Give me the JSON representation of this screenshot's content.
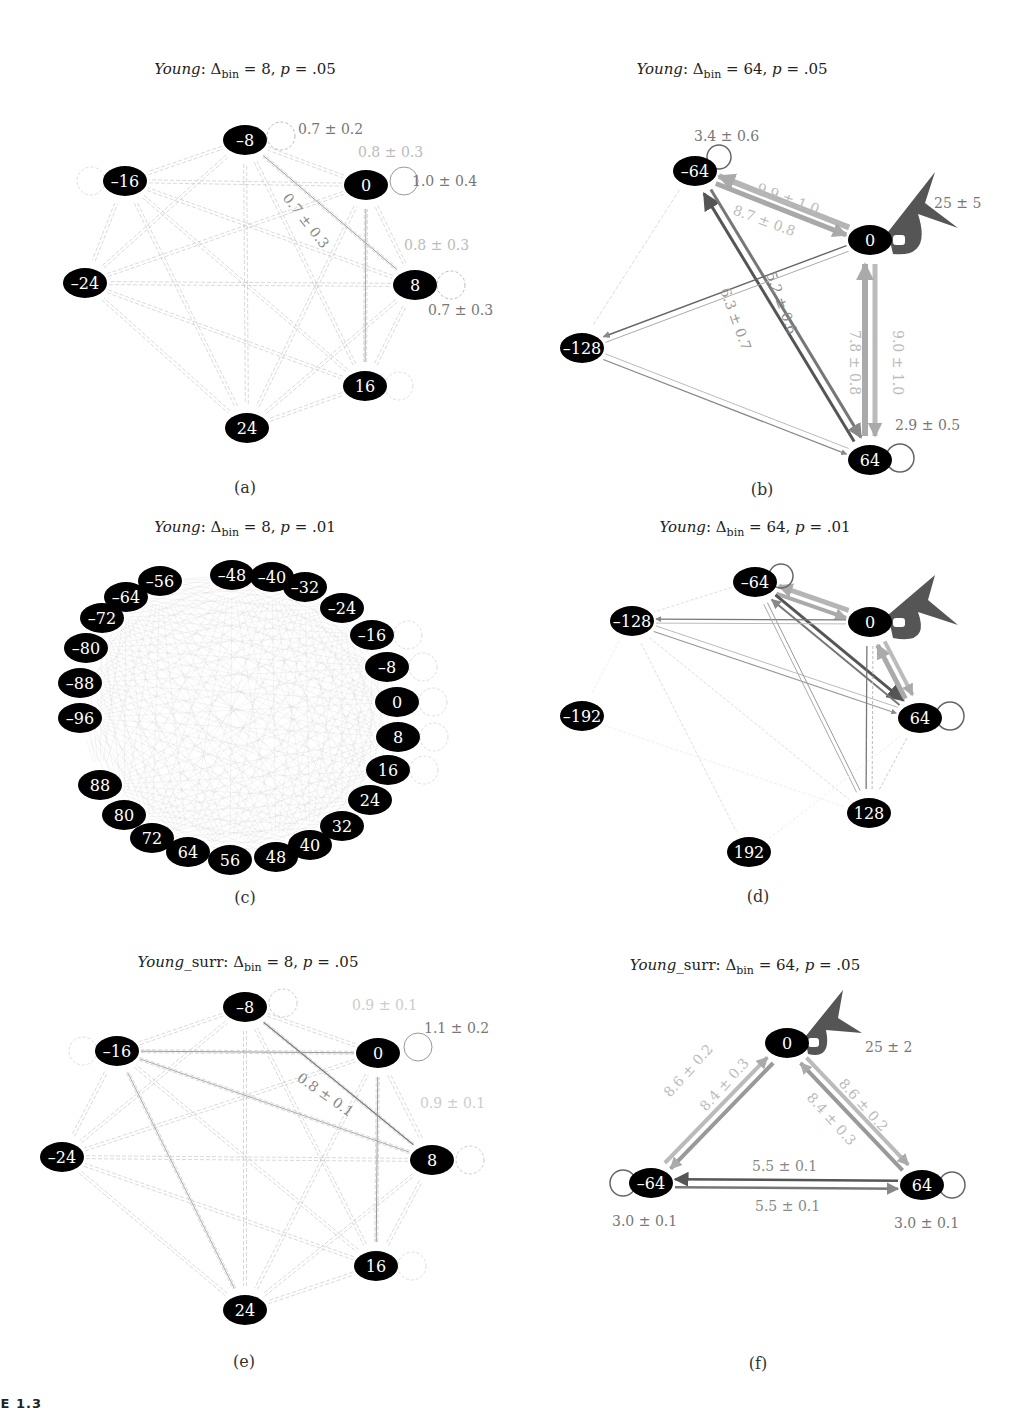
{
  "figure": {
    "caption_partial": "URE 1.3"
  },
  "chart_data": [
    {
      "type": "network",
      "panel": "a",
      "title": {
        "group": "Young",
        "delta_bin": "8",
        "p": ".05"
      },
      "label": "(a)",
      "nodes": [
        {
          "id": "-8",
          "label": "–8",
          "x": 245,
          "y": 140
        },
        {
          "id": "-16",
          "label": "–16",
          "x": 125,
          "y": 181
        },
        {
          "id": "0",
          "label": "0",
          "x": 366,
          "y": 185
        },
        {
          "id": "-24",
          "label": "–24",
          "x": 85,
          "y": 283
        },
        {
          "id": "8",
          "label": "8",
          "x": 415,
          "y": 285
        },
        {
          "id": "16",
          "label": "16",
          "x": 365,
          "y": 386
        },
        {
          "id": "24",
          "label": "24",
          "x": 247,
          "y": 428
        }
      ],
      "edge_labels": [
        {
          "text": "0.7 ± 0.2",
          "x": 298,
          "y": 134,
          "color": "#777",
          "rotate": 0
        },
        {
          "text": "0.8 ± 0.3",
          "x": 358,
          "y": 157,
          "color": "#bbb",
          "rotate": 0
        },
        {
          "text": "1.0 ± 0.4",
          "x": 412,
          "y": 186,
          "color": "#777",
          "rotate": 0
        },
        {
          "text": "0.7 ± 0.3",
          "x": 282,
          "y": 198,
          "color": "#888",
          "rotate": 52
        },
        {
          "text": "0.8 ± 0.3",
          "x": 404,
          "y": 250,
          "color": "#bbb",
          "rotate": 0
        },
        {
          "text": "0.7 ± 0.3",
          "x": 428,
          "y": 315,
          "color": "#777",
          "rotate": 0
        }
      ]
    },
    {
      "type": "network",
      "panel": "b",
      "title": {
        "group": "Young",
        "delta_bin": "64",
        "p": ".05"
      },
      "label": "(b)",
      "nodes": [
        {
          "id": "-64",
          "label": "–64",
          "x": 695,
          "y": 171
        },
        {
          "id": "0",
          "label": "0",
          "x": 870,
          "y": 240
        },
        {
          "id": "-128",
          "label": "–128",
          "x": 582,
          "y": 348
        },
        {
          "id": "64",
          "label": "64",
          "x": 870,
          "y": 460
        }
      ],
      "edges": [
        {
          "from": "0",
          "to": "-64",
          "value": "9.9 ± 1.0"
        },
        {
          "from": "-64",
          "to": "0",
          "value": "8.7 ± 0.8"
        },
        {
          "from": "64",
          "to": "-64",
          "value": "6.3 ± 0.7"
        },
        {
          "from": "-64",
          "to": "64",
          "value": "5.2 ± 0.6"
        },
        {
          "from": "0",
          "to": "64",
          "value": "7.8 ± 0.8"
        },
        {
          "from": "64",
          "to": "0",
          "value": "9.0 ± 1.0"
        },
        {
          "from": "-64",
          "to": "-64",
          "value": "3.4 ± 0.6"
        },
        {
          "from": "0",
          "to": "0",
          "value": "25 ± 5"
        },
        {
          "from": "64",
          "to": "64",
          "value": "2.9 ± 0.5"
        }
      ],
      "edge_labels": [
        {
          "text": "3.4 ± 0.6",
          "x": 694,
          "y": 141,
          "color": "#777",
          "rotate": 0
        },
        {
          "text": "9.9 ± 1.0",
          "x": 756,
          "y": 192,
          "color": "#bbb",
          "rotate": 20
        },
        {
          "text": "8.7 ± 0.8",
          "x": 732,
          "y": 214,
          "color": "#bbb",
          "rotate": 20
        },
        {
          "text": "25 ± 5",
          "x": 934,
          "y": 208,
          "color": "#777",
          "rotate": 0
        },
        {
          "text": "5.2 ± 0.6",
          "x": 766,
          "y": 274,
          "color": "#888",
          "rotate": 70
        },
        {
          "text": "6.3 ± 0.7",
          "x": 720,
          "y": 290,
          "color": "#999",
          "rotate": 70
        },
        {
          "text": "7.8 ± 0.8",
          "x": 850,
          "y": 330,
          "color": "#bbb",
          "rotate": 90
        },
        {
          "text": "9.0 ± 1.0",
          "x": 893,
          "y": 330,
          "color": "#bbb",
          "rotate": 90
        },
        {
          "text": "2.9 ± 0.5",
          "x": 895,
          "y": 430,
          "color": "#777",
          "rotate": 0
        }
      ]
    },
    {
      "type": "network",
      "panel": "c",
      "title": {
        "group": "Young",
        "delta_bin": "8",
        "p": ".01"
      },
      "label": "(c)",
      "nodes": [
        {
          "id": "0",
          "label": "0"
        },
        {
          "id": "8",
          "label": "8"
        },
        {
          "id": "16",
          "label": "16"
        },
        {
          "id": "24",
          "label": "24"
        },
        {
          "id": "32",
          "label": "32"
        },
        {
          "id": "40",
          "label": "40"
        },
        {
          "id": "48",
          "label": "48"
        },
        {
          "id": "56",
          "label": "56"
        },
        {
          "id": "64",
          "label": "64"
        },
        {
          "id": "72",
          "label": "72"
        },
        {
          "id": "80",
          "label": "80"
        },
        {
          "id": "88",
          "label": "88"
        },
        {
          "id": "-96",
          "label": "–96"
        },
        {
          "id": "-88",
          "label": "–88"
        },
        {
          "id": "-80",
          "label": "–80"
        },
        {
          "id": "-72",
          "label": "–72"
        },
        {
          "id": "-64",
          "label": "–64"
        },
        {
          "id": "-56",
          "label": "–56"
        },
        {
          "id": "-48",
          "label": "–48"
        },
        {
          "id": "-40",
          "label": "–40"
        },
        {
          "id": "-32",
          "label": "–32"
        },
        {
          "id": "-24",
          "label": "–24"
        },
        {
          "id": "-16",
          "label": "–16"
        },
        {
          "id": "-8",
          "label": "–8"
        }
      ],
      "node_positions": [
        [
          397,
          702
        ],
        [
          398,
          737
        ],
        [
          388,
          770
        ],
        [
          370,
          800
        ],
        [
          342,
          826
        ],
        [
          310,
          845
        ],
        [
          276,
          857
        ],
        [
          230,
          860
        ],
        [
          188,
          852
        ],
        [
          152,
          838
        ],
        [
          124,
          815
        ],
        [
          100,
          785
        ],
        [
          80,
          718
        ],
        [
          80,
          683
        ],
        [
          86,
          648
        ],
        [
          102,
          618
        ],
        [
          126,
          597
        ],
        [
          160,
          581
        ],
        [
          232,
          575
        ],
        [
          272,
          577
        ],
        [
          305,
          587
        ],
        [
          342,
          608
        ],
        [
          372,
          635
        ],
        [
          387,
          667
        ]
      ]
    },
    {
      "type": "network",
      "panel": "d",
      "title": {
        "group": "Young",
        "delta_bin": "64",
        "p": ".01"
      },
      "label": "(d)",
      "nodes": [
        {
          "id": "-64",
          "label": "–64",
          "x": 755,
          "y": 582
        },
        {
          "id": "-128",
          "label": "–128",
          "x": 632,
          "y": 621
        },
        {
          "id": "0",
          "label": "0",
          "x": 870,
          "y": 622
        },
        {
          "id": "-192",
          "label": "–192",
          "x": 582,
          "y": 716
        },
        {
          "id": "64",
          "label": "64",
          "x": 920,
          "y": 718
        },
        {
          "id": "128",
          "label": "128",
          "x": 869,
          "y": 813
        },
        {
          "id": "192",
          "label": "192",
          "x": 749,
          "y": 852
        }
      ]
    },
    {
      "type": "network",
      "panel": "e",
      "title": {
        "group": "Young",
        "suffix": "_surr",
        "delta_bin": "8",
        "p": ".05"
      },
      "label": "(e)",
      "nodes": [
        {
          "id": "-8",
          "label": "–8",
          "x": 245,
          "y": 1007
        },
        {
          "id": "-16",
          "label": "–16",
          "x": 117,
          "y": 1051
        },
        {
          "id": "0",
          "label": "0",
          "x": 378,
          "y": 1053
        },
        {
          "id": "-24",
          "label": "–24",
          "x": 62,
          "y": 1157
        },
        {
          "id": "8",
          "label": "8",
          "x": 432,
          "y": 1160
        },
        {
          "id": "16",
          "label": "16",
          "x": 376,
          "y": 1266
        },
        {
          "id": "24",
          "label": "24",
          "x": 245,
          "y": 1310
        }
      ],
      "edge_labels": [
        {
          "text": "0.9 ± 0.1",
          "x": 352,
          "y": 1010,
          "color": "#ccc",
          "rotate": 0
        },
        {
          "text": "1.1 ± 0.2",
          "x": 424,
          "y": 1033,
          "color": "#777",
          "rotate": 0
        },
        {
          "text": "0.8 ± 0.1",
          "x": 296,
          "y": 1080,
          "color": "#888",
          "rotate": 35
        },
        {
          "text": "0.9 ± 0.1",
          "x": 420,
          "y": 1108,
          "color": "#ccc",
          "rotate": 0
        }
      ]
    },
    {
      "type": "network",
      "panel": "f",
      "title": {
        "group": "Young",
        "suffix": "_surr",
        "delta_bin": "64",
        "p": ".05"
      },
      "label": "(f)",
      "nodes": [
        {
          "id": "0",
          "label": "0",
          "x": 787,
          "y": 1043
        },
        {
          "id": "-64",
          "label": "–64",
          "x": 651,
          "y": 1183
        },
        {
          "id": "64",
          "label": "64",
          "x": 922,
          "y": 1185
        }
      ],
      "edges": [
        {
          "from": "0",
          "to": "-64",
          "value": "8.6 ± 0.2"
        },
        {
          "from": "-64",
          "to": "0",
          "value": "8.4 ± 0.3"
        },
        {
          "from": "0",
          "to": "64",
          "value": "8.4 ± 0.3"
        },
        {
          "from": "64",
          "to": "0",
          "value": "8.6 ± 0.2"
        },
        {
          "from": "64",
          "to": "-64",
          "value": "5.5 ± 0.1"
        },
        {
          "from": "-64",
          "to": "64",
          "value": "5.5 ± 0.1"
        },
        {
          "from": "0",
          "to": "0",
          "value": "25 ± 2"
        },
        {
          "from": "-64",
          "to": "-64",
          "value": "3.0 ± 0.1"
        },
        {
          "from": "64",
          "to": "64",
          "value": "3.0 ± 0.1"
        }
      ],
      "edge_labels": [
        {
          "text": "25 ± 2",
          "x": 865,
          "y": 1052,
          "color": "#777",
          "rotate": 0
        },
        {
          "text": "8.6 ± 0.2",
          "x": 670,
          "y": 1098,
          "color": "#bbb",
          "rotate": -48
        },
        {
          "text": "8.4 ± 0.3",
          "x": 706,
          "y": 1112,
          "color": "#bbb",
          "rotate": -48
        },
        {
          "text": "8.4 ± 0.3",
          "x": 806,
          "y": 1098,
          "color": "#bbb",
          "rotate": 48
        },
        {
          "text": "8.6 ± 0.2",
          "x": 838,
          "y": 1084,
          "color": "#bbb",
          "rotate": 48
        },
        {
          "text": "5.5 ± 0.1",
          "x": 752,
          "y": 1171,
          "color": "#888",
          "rotate": 0
        },
        {
          "text": "5.5 ± 0.1",
          "x": 755,
          "y": 1211,
          "color": "#888",
          "rotate": 0
        },
        {
          "text": "3.0 ± 0.1",
          "x": 612,
          "y": 1226,
          "color": "#777",
          "rotate": 0
        },
        {
          "text": "3.0 ± 0.1",
          "x": 894,
          "y": 1228,
          "color": "#777",
          "rotate": 0
        }
      ]
    }
  ]
}
